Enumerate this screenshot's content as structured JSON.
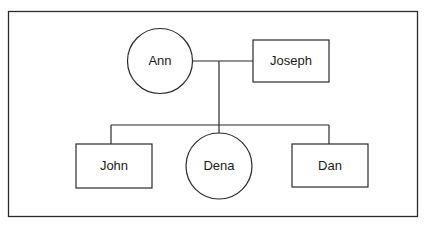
{
  "diagram": {
    "type": "family-tree",
    "parents": [
      {
        "name": "Ann",
        "shape": "circle"
      },
      {
        "name": "Joseph",
        "shape": "square"
      }
    ],
    "children": [
      {
        "name": "John",
        "shape": "square"
      },
      {
        "name": "Dena",
        "shape": "circle"
      },
      {
        "name": "Dan",
        "shape": "square"
      }
    ],
    "colors": {
      "line": "#2a2a2a",
      "background": "#ffffff"
    }
  }
}
